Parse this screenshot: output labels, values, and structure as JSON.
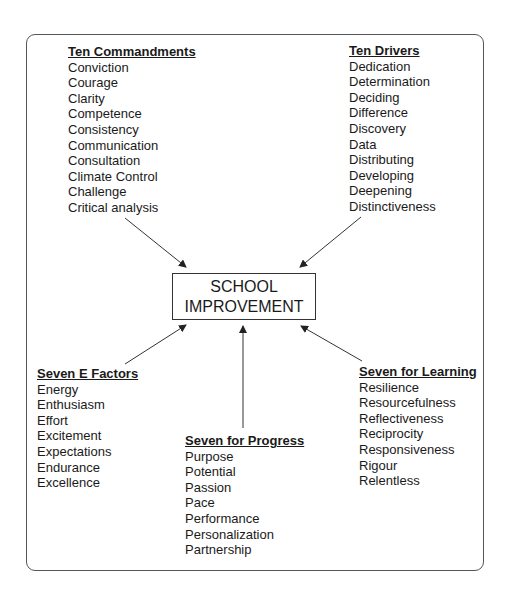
{
  "center": {
    "line1": "SCHOOL",
    "line2": "IMPROVEMENT"
  },
  "groups": {
    "ten_commandments": {
      "title": "Ten Commandments",
      "items": [
        "Conviction",
        "Courage",
        "Clarity",
        "Competence",
        "Consistency",
        "Communication",
        "Consultation",
        "Climate Control",
        "Challenge",
        "Critical analysis"
      ]
    },
    "ten_drivers": {
      "title": "Ten Drivers",
      "items": [
        "Dedication",
        "Determination",
        "Deciding",
        "Difference",
        "Discovery",
        "Data",
        "Distributing",
        "Developing",
        "Deepening",
        "Distinctiveness"
      ]
    },
    "seven_e_factors": {
      "title": "Seven E Factors",
      "items": [
        "Energy",
        "Enthusiasm",
        "Effort",
        "Excitement",
        "Expectations",
        "Endurance",
        "Excellence"
      ]
    },
    "seven_for_progress": {
      "title": "Seven for Progress",
      "items": [
        "Purpose",
        "Potential",
        "Passion",
        "Pace",
        "Performance",
        "Personalization",
        "Partnership"
      ]
    },
    "seven_for_learning": {
      "title": "Seven for Learning",
      "items": [
        "Resilience",
        "Resourcefulness",
        "Reflectiveness",
        "Reciprocity",
        "Responsiveness",
        "Rigour",
        "Relentless"
      ]
    }
  }
}
